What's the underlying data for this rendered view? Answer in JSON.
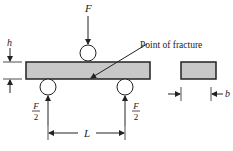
{
  "diagram": {
    "type": "three-point bending test",
    "labels": {
      "load": "F",
      "height": "h",
      "reaction_num": "F",
      "reaction_den": "2",
      "span": "L",
      "width": "b",
      "fracture": "Point of fracture"
    },
    "colors": {
      "beam_fill": "#c8c8c8",
      "stroke": "#222222"
    }
  }
}
